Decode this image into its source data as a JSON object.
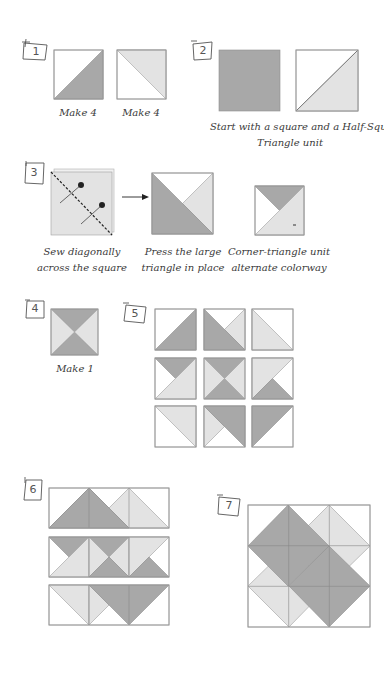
{
  "colors": {
    "dark": "#a8a8a8",
    "light": "#e3e3e3",
    "white": "#ffffff",
    "outline": "#9a9a9a",
    "line": "#444444"
  },
  "steps": [
    {
      "number": "1",
      "captions": [
        "Make 4",
        "Make 4"
      ]
    },
    {
      "number": "2",
      "captions": [
        "Start with a square and a Half-Square",
        "Triangle unit"
      ]
    },
    {
      "number": "3",
      "captions": [
        "Sew diagonally",
        "across the square",
        "Press the large",
        "triangle in place",
        "Corner-triangle unit",
        "alternate colorway"
      ]
    },
    {
      "number": "4",
      "captions": [
        "Make 1"
      ]
    },
    {
      "number": "5",
      "captions": []
    },
    {
      "number": "6",
      "captions": []
    },
    {
      "number": "7",
      "captions": []
    }
  ],
  "icons": {
    "arrow": "right-arrow-icon",
    "pin": "pin-icon",
    "stitch": "dashed-stitch-line"
  }
}
